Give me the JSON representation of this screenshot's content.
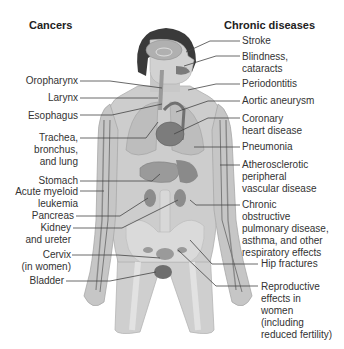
{
  "diagram": {
    "headers": {
      "left": "Cancers",
      "right": "Chronic diseases"
    },
    "cancers": [
      {
        "label": "Oropharynx"
      },
      {
        "label": "Larynx"
      },
      {
        "label": "Esophagus"
      },
      {
        "label": "Trachea,\nbronchus,\nand lung"
      },
      {
        "label": "Stomach"
      },
      {
        "label": "Acute myeloid\nleukemia"
      },
      {
        "label": "Pancreas"
      },
      {
        "label": "Kidney\nand ureter"
      },
      {
        "label": "Cervix\n(in women)"
      },
      {
        "label": "Bladder"
      }
    ],
    "chronic_diseases": [
      {
        "label": "Stroke"
      },
      {
        "label": "Blindness,\ncataracts"
      },
      {
        "label": "Periodontitis"
      },
      {
        "label": "Aortic aneurysm"
      },
      {
        "label": "Coronary\nheart disease"
      },
      {
        "label": "Pneumonia"
      },
      {
        "label": "Atherosclerotic\nperipheral\nvascular disease"
      },
      {
        "label": "Chronic\nobstructive\npulmonary disease,\nasthma, and other\nrespiratory effects"
      },
      {
        "label": "Hip fractures"
      },
      {
        "label": "Reproductive\neffects in\nwomen\n(including\nreduced fertility)"
      }
    ],
    "colors": {
      "body": "#c9c9c9",
      "body_dark": "#a9a9a9",
      "hair": "#3a3a3a",
      "organ": "#8f8f8f",
      "organ_dark": "#6e6e6e",
      "line": "#444444"
    }
  }
}
